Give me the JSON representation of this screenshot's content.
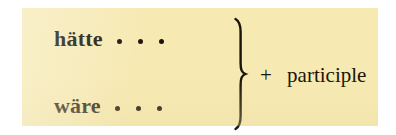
{
  "figure": {
    "panel_color": "#f6e9b2",
    "text_color": "#1a1509",
    "page_color": "#ffffff",
    "rows": [
      {
        "headword": "hätte",
        "ellipsis": "..."
      },
      {
        "headword": "wäre",
        "ellipsis": "..."
      }
    ],
    "brace": "right-curly-brace",
    "trailing": {
      "plus": "+",
      "label": "participle"
    }
  }
}
